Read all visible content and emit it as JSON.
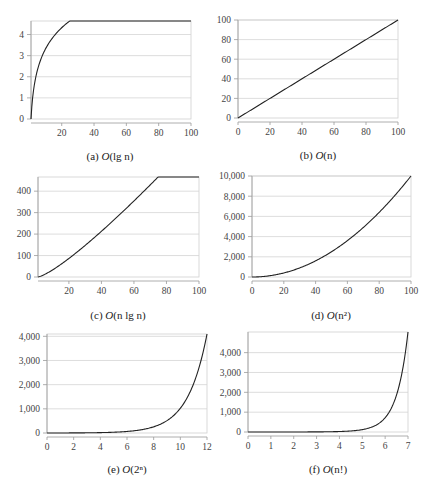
{
  "chart_data": [
    {
      "id": "a",
      "type": "line",
      "caption_prefix": "(a) ",
      "caption_func": "O",
      "caption_arg": "(lg n)",
      "function": "lg n",
      "xlim": [
        1,
        100
      ],
      "ylim": [
        0,
        4.64
      ],
      "xticks": [
        20,
        40,
        60,
        80,
        100
      ],
      "xtick_labels": [
        "20",
        "40",
        "60",
        "80",
        "100"
      ],
      "yticks": [
        0,
        1,
        2,
        3,
        4
      ],
      "ytick_labels": [
        "0",
        "1",
        "2",
        "3",
        "4"
      ],
      "grid": true,
      "series": [
        {
          "name": "lg n",
          "x": [
            1,
            2,
            3,
            4,
            5,
            8,
            10,
            15,
            20,
            30,
            40,
            50,
            60,
            70,
            80,
            90,
            100
          ],
          "y": [
            0,
            1,
            1.58,
            2,
            2.32,
            3,
            3.32,
            3.91,
            4.32,
            4.91,
            5.32,
            5.64,
            5.91,
            6.13,
            6.32,
            6.49,
            6.64
          ]
        }
      ]
    },
    {
      "id": "b",
      "type": "line",
      "caption_prefix": "(b) ",
      "caption_func": "O",
      "caption_arg": "(n)",
      "function": "n",
      "xlim": [
        0,
        100
      ],
      "ylim": [
        0,
        100
      ],
      "xticks": [
        0,
        20,
        40,
        60,
        80,
        100
      ],
      "xtick_labels": [
        "0",
        "20",
        "40",
        "60",
        "80",
        "100"
      ],
      "yticks": [
        0,
        20,
        40,
        60,
        80,
        100
      ],
      "ytick_labels": [
        "0",
        "20",
        "40",
        "60",
        "80",
        "100"
      ],
      "grid": true,
      "series": [
        {
          "name": "n",
          "x": [
            0,
            100
          ],
          "y": [
            0,
            100
          ]
        }
      ]
    },
    {
      "id": "c",
      "type": "line",
      "caption_prefix": "(c) ",
      "caption_func": "O",
      "caption_arg": "(n lg n)",
      "function": "n lg n",
      "xlim": [
        1,
        100
      ],
      "ylim": [
        0,
        466
      ],
      "xticks": [
        20,
        40,
        60,
        80,
        100
      ],
      "xtick_labels": [
        "20",
        "40",
        "60",
        "80",
        "100"
      ],
      "yticks": [
        0,
        100,
        200,
        300,
        400
      ],
      "ytick_labels": [
        "0",
        "100",
        "200",
        "300",
        "400"
      ],
      "grid": true,
      "series": [
        {
          "name": "n lg n",
          "x": [
            1,
            10,
            20,
            30,
            40,
            50,
            60,
            70,
            80,
            90,
            100
          ],
          "y": [
            0,
            33.2,
            86.4,
            147.2,
            212.9,
            282.2,
            354.4,
            429.1,
            505.8,
            584.3,
            664.4
          ]
        }
      ]
    },
    {
      "id": "d",
      "type": "line",
      "caption_prefix": "(d) ",
      "caption_func": "O",
      "caption_arg": "(n²)",
      "function": "n^2",
      "xlim": [
        0,
        100
      ],
      "ylim": [
        0,
        10000
      ],
      "xticks": [
        0,
        20,
        40,
        60,
        80,
        100
      ],
      "xtick_labels": [
        "0",
        "20",
        "40",
        "60",
        "80",
        "100"
      ],
      "yticks": [
        0,
        2000,
        4000,
        6000,
        8000,
        10000
      ],
      "ytick_labels": [
        "0",
        "2,000",
        "4,000",
        "6,000",
        "8,000",
        "10,000"
      ],
      "grid": true,
      "series": [
        {
          "name": "n^2",
          "x": [
            0,
            20,
            40,
            60,
            80,
            100
          ],
          "y": [
            0,
            400,
            1600,
            3600,
            6400,
            10000
          ]
        }
      ]
    },
    {
      "id": "e",
      "type": "line",
      "caption_prefix": "(e) ",
      "caption_func": "O",
      "caption_arg": "(2ⁿ)",
      "function": "2^n",
      "xlim": [
        0,
        12
      ],
      "ylim": [
        0,
        4096
      ],
      "xticks": [
        0,
        2,
        4,
        6,
        8,
        10,
        12
      ],
      "xtick_labels": [
        "0",
        "2",
        "4",
        "6",
        "8",
        "10",
        "12"
      ],
      "yticks": [
        0,
        1000,
        2000,
        3000,
        4000
      ],
      "ytick_labels": [
        "0",
        "1,000",
        "2,000",
        "3,000",
        "4,000"
      ],
      "grid": true,
      "series": [
        {
          "name": "2^n",
          "x": [
            0,
            2,
            4,
            6,
            8,
            10,
            12
          ],
          "y": [
            1,
            4,
            16,
            64,
            256,
            1024,
            4096
          ]
        }
      ]
    },
    {
      "id": "f",
      "type": "line",
      "caption_prefix": "(f) ",
      "caption_func": "O",
      "caption_arg": "(n!)",
      "function": "n!",
      "xlim": [
        0,
        7
      ],
      "ylim": [
        0,
        5040
      ],
      "xticks": [
        0,
        1,
        2,
        3,
        4,
        5,
        6,
        7
      ],
      "xtick_labels": [
        "0",
        "1",
        "2",
        "3",
        "4",
        "5",
        "6",
        "7"
      ],
      "yticks": [
        0,
        1000,
        2000,
        3000,
        4000
      ],
      "ytick_labels": [
        "0",
        "1,000",
        "2,000",
        "3,000",
        "4,000"
      ],
      "grid": true,
      "series": [
        {
          "name": "n!",
          "x": [
            0,
            1,
            2,
            3,
            4,
            5,
            6,
            7
          ],
          "y": [
            1,
            1,
            2,
            6,
            24,
            120,
            720,
            5040
          ]
        }
      ]
    }
  ]
}
